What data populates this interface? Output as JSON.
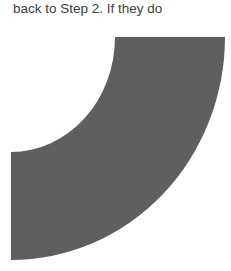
{
  "document": {
    "text_line": "back to Step 2. If they do",
    "figure": {
      "shape": "quarter-ring",
      "fill_color": "#5f5f5f"
    }
  }
}
